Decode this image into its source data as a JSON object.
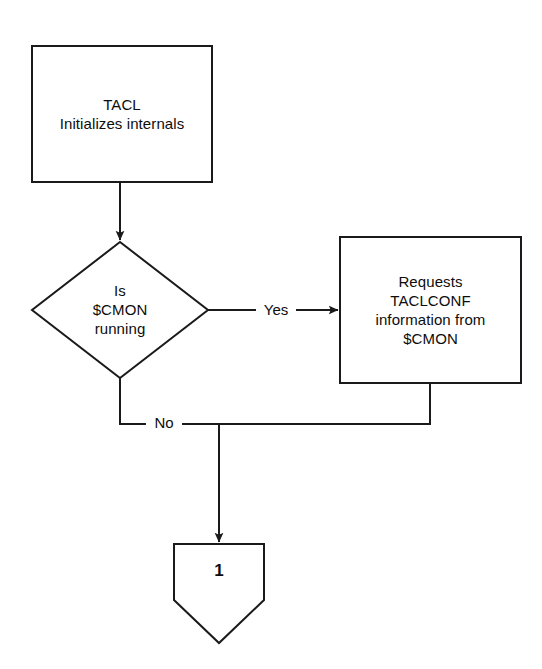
{
  "diagram": {
    "width": 542,
    "height": 669,
    "background_color": "#ffffff",
    "stroke_color": "#1a1a1a",
    "text_color": "#0d0d0d"
  },
  "nodes": {
    "process_tacl_init": {
      "shape": "rectangle",
      "text": "TACL\nInitializes internals",
      "line1": "TACL",
      "line2": "Initializes internals",
      "x": 32,
      "y": 46,
      "width": 180,
      "height": 136
    },
    "decision_cmon_running": {
      "shape": "diamond",
      "text": "Is\n$CMON\nrunning",
      "line1": "Is",
      "line2": "$CMON",
      "line3": "running",
      "cx": 120,
      "cy": 310,
      "half_width": 88,
      "half_height": 68
    },
    "process_request_taclconf": {
      "shape": "rectangle",
      "text": "Requests\nTACLCONF\ninformation from\n$CMON",
      "line1": "Requests",
      "line2": "TACLCONF",
      "line3": "information from",
      "line4": "$CMON",
      "x": 340,
      "y": 237,
      "width": 181,
      "height": 146
    },
    "connector_one": {
      "shape": "pentagon-down",
      "text": "1",
      "x": 174,
      "y": 544,
      "width": 90,
      "height": 99
    }
  },
  "edges": {
    "tacl_to_decision": {
      "label": "",
      "from": "process_tacl_init",
      "to": "decision_cmon_running",
      "arrow": true
    },
    "decision_yes": {
      "label": "Yes",
      "from": "decision_cmon_running",
      "to": "process_request_taclconf",
      "arrow": true
    },
    "decision_no": {
      "label": "No",
      "from": "decision_cmon_running",
      "to": "connector_one",
      "arrow": true
    },
    "taclconf_to_connector": {
      "label": "",
      "from": "process_request_taclconf",
      "to": "connector_one",
      "arrow": true
    }
  }
}
